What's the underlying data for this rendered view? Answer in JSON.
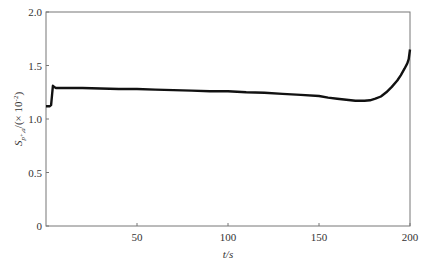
{
  "chart_data": {
    "type": "line",
    "title": "",
    "xlabel": "t/s",
    "ylabel": "S_{p+,a}/(×10⁻²)",
    "ylabel_parts": {
      "main": "S",
      "sub": "p⁺,a",
      "unit": "/(× 10",
      "exp": "-2",
      "close": ")"
    },
    "xlim": [
      0,
      200
    ],
    "ylim": [
      0,
      2.0
    ],
    "xticks": [
      50,
      100,
      150,
      200
    ],
    "xtick_labels": [
      "50",
      "100",
      "150",
      "200"
    ],
    "yticks": [
      0,
      0.5,
      1.0,
      1.5,
      2.0
    ],
    "ytick_labels": [
      "0",
      "0.5",
      "1.0",
      "1.5",
      "2.0"
    ],
    "grid": false,
    "legend": null,
    "series": [
      {
        "name": "S",
        "color": "#111111",
        "x": [
          0,
          1,
          2,
          2.8,
          3.3,
          3.8,
          4.5,
          5.5,
          7,
          10,
          20,
          30,
          40,
          50,
          60,
          70,
          80,
          90,
          100,
          110,
          120,
          130,
          140,
          150,
          155,
          160,
          165,
          170,
          175,
          178,
          181,
          184,
          187,
          190,
          193,
          195,
          197,
          198.5,
          199.3,
          200
        ],
        "y": [
          1.12,
          1.12,
          1.12,
          1.13,
          1.22,
          1.31,
          1.3,
          1.29,
          1.29,
          1.29,
          1.29,
          1.285,
          1.28,
          1.28,
          1.275,
          1.27,
          1.265,
          1.26,
          1.26,
          1.25,
          1.245,
          1.235,
          1.225,
          1.215,
          1.2,
          1.19,
          1.18,
          1.17,
          1.17,
          1.175,
          1.19,
          1.21,
          1.25,
          1.3,
          1.36,
          1.41,
          1.47,
          1.52,
          1.56,
          1.65
        ]
      }
    ]
  }
}
